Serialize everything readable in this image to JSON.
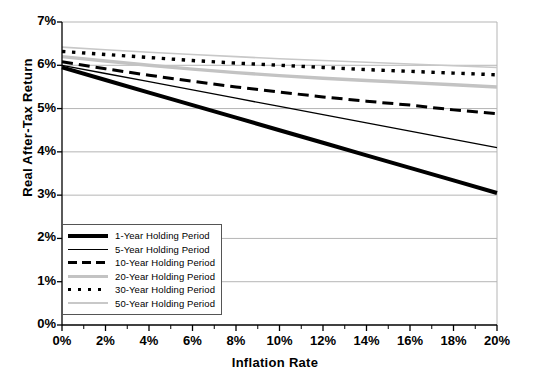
{
  "chart_data": {
    "type": "line",
    "title": "",
    "xlabel": "Inflation Rate",
    "ylabel": "Real After-Tax Return",
    "xlim": [
      0,
      20
    ],
    "ylim": [
      0,
      7
    ],
    "x_ticks": [
      "0%",
      "2%",
      "4%",
      "6%",
      "8%",
      "10%",
      "12%",
      "14%",
      "16%",
      "18%",
      "20%"
    ],
    "x_tick_values": [
      0,
      2,
      4,
      6,
      8,
      10,
      12,
      14,
      16,
      18,
      20
    ],
    "y_ticks": [
      "0%",
      "1%",
      "2%",
      "3%",
      "4%",
      "5%",
      "6%",
      "7%"
    ],
    "y_tick_values": [
      0,
      1,
      2,
      3,
      4,
      5,
      6,
      7
    ],
    "grid": "horizontal",
    "legend_position": "lower-left-inside",
    "x": [
      0,
      2,
      4,
      6,
      8,
      10,
      12,
      14,
      16,
      18,
      20
    ],
    "series": [
      {
        "name": "1-Year Holding Period",
        "style": "solid",
        "width": 4,
        "color": "#000000",
        "values": [
          5.95,
          5.66,
          5.37,
          5.08,
          4.79,
          4.5,
          4.21,
          3.92,
          3.63,
          3.34,
          3.05
        ]
      },
      {
        "name": "5-Year Holding Period",
        "style": "solid",
        "width": 1.3,
        "color": "#000000",
        "values": [
          6.0,
          5.81,
          5.62,
          5.43,
          5.24,
          5.05,
          4.86,
          4.67,
          4.48,
          4.29,
          4.1
        ]
      },
      {
        "name": "10-Year Holding Period",
        "style": "dashed",
        "width": 3,
        "color": "#000000",
        "values": [
          6.08,
          5.92,
          5.77,
          5.63,
          5.5,
          5.38,
          5.27,
          5.17,
          5.08,
          4.97,
          4.88
        ]
      },
      {
        "name": "20-Year Holding Period",
        "style": "solid",
        "width": 3.4,
        "color": "#c3c3c3",
        "values": [
          6.2,
          6.1,
          6.0,
          5.91,
          5.83,
          5.76,
          5.7,
          5.65,
          5.6,
          5.55,
          5.5
        ]
      },
      {
        "name": "30-Year Holding Period",
        "style": "dotted",
        "width": 3.4,
        "color": "#000000",
        "values": [
          6.32,
          6.25,
          6.18,
          6.11,
          6.05,
          6.0,
          5.95,
          5.9,
          5.86,
          5.82,
          5.78
        ]
      },
      {
        "name": "50-Year Holding Period",
        "style": "solid",
        "width": 1.6,
        "color": "#c8c8c8",
        "values": [
          6.42,
          6.36,
          6.3,
          6.25,
          6.2,
          6.15,
          6.11,
          6.07,
          6.03,
          5.99,
          5.95
        ]
      }
    ]
  },
  "legend": {
    "items": [
      {
        "label": "1-Year Holding Period"
      },
      {
        "label": "5-Year Holding Period"
      },
      {
        "label": "10-Year Holding Period"
      },
      {
        "label": "20-Year Holding Period"
      },
      {
        "label": "30-Year Holding Period"
      },
      {
        "label": "50-Year Holding Period"
      }
    ]
  },
  "colors": {
    "axis": "#000000",
    "grid": "#b5b5b5",
    "background": "#ffffff"
  }
}
